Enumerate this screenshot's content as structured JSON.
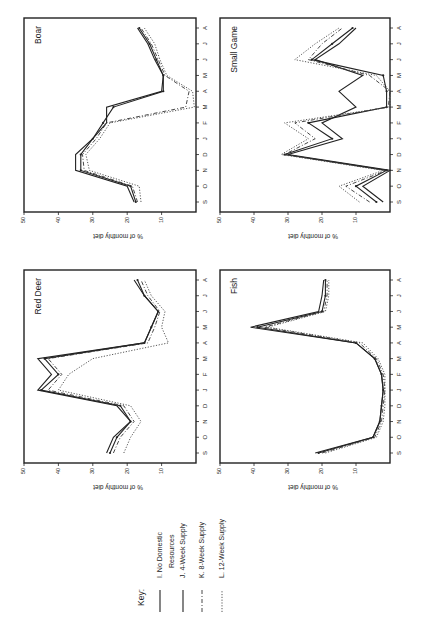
{
  "figure": {
    "orientation": "rotated-90-ccw",
    "ylabel": "% of monthly diet",
    "value_ticks": [
      50,
      40,
      30,
      20,
      10
    ],
    "months": [
      "S",
      "O",
      "N",
      "D",
      "J",
      "F",
      "M",
      "A",
      "M",
      "J",
      "J",
      "A"
    ]
  },
  "legend": {
    "title": "Key:",
    "items": [
      {
        "id": "I",
        "label_line1": "I.  No Domestic",
        "label_line2": "Resources",
        "style": "solid-thin"
      },
      {
        "id": "J",
        "label_line1": "J.  4-Week  Supply",
        "label_line2": "",
        "style": "solid-dot"
      },
      {
        "id": "K",
        "label_line1": "K.  8-Week  Supply",
        "label_line2": "",
        "style": "dash-dot"
      },
      {
        "id": "L",
        "label_line1": "L.  12-Week  Supply",
        "label_line2": "",
        "style": "dotted"
      }
    ]
  },
  "chart_data": [
    {
      "type": "line",
      "title": "Boar",
      "panel": "top-left",
      "xlabel": "",
      "ylabel": "% of monthly diet",
      "ylim": [
        0,
        50
      ],
      "categories": [
        "S",
        "O",
        "N",
        "D",
        "J",
        "F",
        "M",
        "A",
        "M",
        "J",
        "J",
        "A"
      ],
      "series": [
        {
          "name": "I. No Domestic Resources",
          "values": [
            18,
            20,
            35,
            35,
            30,
            26,
            26,
            10,
            9.5,
            12,
            14,
            17
          ]
        },
        {
          "name": "J. 4-Week Supply",
          "values": [
            17.5,
            19,
            33.5,
            33.5,
            30,
            27,
            24,
            9.5,
            9.5,
            11.5,
            13.5,
            16.5
          ]
        },
        {
          "name": "K. 8-Week Supply",
          "values": [
            17,
            18.5,
            32.5,
            33,
            29,
            26,
            3,
            2,
            9,
            11,
            13,
            16
          ]
        },
        {
          "name": "L. 12-Week Supply",
          "values": [
            16,
            16.5,
            31,
            32,
            28,
            25,
            0.5,
            1,
            8.5,
            10.5,
            12,
            15
          ]
        }
      ]
    },
    {
      "type": "line",
      "title": "Small Game",
      "panel": "top-right",
      "xlabel": "",
      "ylabel": "% of monthly diet",
      "ylim": [
        0,
        50
      ],
      "categories": [
        "S",
        "O",
        "N",
        "D",
        "J",
        "F",
        "M",
        "A",
        "M",
        "J",
        "J",
        "A"
      ],
      "series": [
        {
          "name": "I. No Domestic Resources",
          "values": [
            2,
            8,
            0,
            30,
            14,
            20,
            10,
            15,
            8,
            22,
            15,
            10
          ]
        },
        {
          "name": "J. 4-Week Supply",
          "values": [
            4,
            10,
            1,
            31,
            17,
            24,
            1,
            1,
            2,
            23,
            17,
            11
          ]
        },
        {
          "name": "K. 8-Week Supply",
          "values": [
            6,
            13,
            1,
            31,
            22,
            28,
            0.5,
            0,
            6,
            24,
            20,
            14
          ]
        },
        {
          "name": "L. 12-Week Supply",
          "values": [
            9,
            15,
            2,
            32,
            24,
            31,
            0,
            0,
            4,
            28,
            22,
            15
          ]
        }
      ]
    },
    {
      "type": "line",
      "title": "Red Deer",
      "panel": "bottom-left",
      "xlabel": "",
      "ylabel": "% of monthly diet",
      "ylim": [
        0,
        50
      ],
      "categories": [
        "S",
        "O",
        "N",
        "D",
        "J",
        "F",
        "M",
        "A",
        "M",
        "J",
        "J",
        "A"
      ],
      "series": [
        {
          "name": "I. No Domestic Resources",
          "values": [
            26,
            24,
            19,
            23,
            46,
            42,
            46,
            15,
            13,
            11,
            15,
            18
          ]
        },
        {
          "name": "J. 4-Week Supply",
          "values": [
            25,
            23,
            19,
            22,
            45,
            40,
            44,
            15,
            13,
            11,
            15,
            17
          ]
        },
        {
          "name": "K. 8-Week Supply",
          "values": [
            24,
            22,
            18,
            21,
            43,
            39,
            43,
            14,
            12,
            10.5,
            14,
            16
          ]
        },
        {
          "name": "L. 12-Week Supply",
          "values": [
            21,
            19,
            16,
            19,
            40,
            37,
            30,
            8,
            10,
            9,
            13,
            15
          ]
        }
      ]
    },
    {
      "type": "line",
      "title": "Fish",
      "panel": "bottom-right",
      "xlabel": "",
      "ylabel": "% of monthly diet",
      "ylim": [
        0,
        50
      ],
      "categories": [
        "S",
        "O",
        "N",
        "D",
        "J",
        "F",
        "M",
        "A",
        "M",
        "J",
        "J",
        "A"
      ],
      "series": [
        {
          "name": "I. No Domestic Resources",
          "values": [
            22,
            5,
            3,
            2.5,
            2,
            2.5,
            4.5,
            10,
            41,
            21,
            20,
            19.5
          ]
        },
        {
          "name": "J. 4-Week Supply",
          "values": [
            21,
            5,
            3,
            2.5,
            2,
            2.5,
            4.5,
            10,
            39,
            20,
            19,
            19
          ]
        },
        {
          "name": "K. 8-Week Supply",
          "values": [
            20,
            4.5,
            2.5,
            2,
            1.5,
            2,
            4,
            9,
            37,
            19.5,
            18.5,
            18.5
          ]
        },
        {
          "name": "L. 12-Week Supply",
          "values": [
            19,
            4,
            2,
            1.5,
            1.5,
            1.5,
            3.5,
            8,
            36,
            19,
            18,
            18
          ]
        }
      ]
    }
  ]
}
